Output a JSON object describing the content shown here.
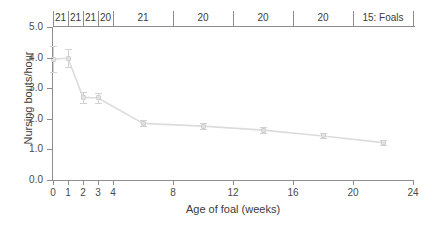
{
  "chart": {
    "ylabel": "Nursing bouts/hour",
    "xlabel": "Age of foal (weeks)",
    "y_ticks": [
      "0.0",
      "1.0",
      "2.0",
      "3.0",
      "4.0",
      "5.0"
    ],
    "x_ticks": [
      "0",
      "1",
      "2",
      "3",
      "4",
      "8",
      "12",
      "16",
      "20",
      "24"
    ],
    "sample_sizes": [
      {
        "label": "21",
        "x_start": 0,
        "x_end": 1
      },
      {
        "label": "21",
        "x_start": 1,
        "x_end": 2
      },
      {
        "label": "21",
        "x_start": 2,
        "x_end": 3
      },
      {
        "label": "20",
        "x_start": 3,
        "x_end": 4
      },
      {
        "label": "21",
        "x_start": 4,
        "x_end": 8
      },
      {
        "label": "20",
        "x_start": 8,
        "x_end": 12
      },
      {
        "label": "20",
        "x_start": 12,
        "x_end": 16
      },
      {
        "label": "20",
        "x_start": 16,
        "x_end": 20
      },
      {
        "label": "15: Foals",
        "x_start": 20,
        "x_end": 24
      }
    ]
  },
  "chart_data": {
    "type": "line",
    "title": "",
    "xlabel": "Age of foal (weeks)",
    "ylabel": "Nursing bouts/hour",
    "xlim": [
      0,
      24
    ],
    "ylim": [
      0.0,
      5.0
    ],
    "xticks": [
      0,
      1,
      2,
      3,
      4,
      8,
      12,
      16,
      20,
      24
    ],
    "yticks": [
      0.0,
      1.0,
      2.0,
      3.0,
      4.0,
      5.0
    ],
    "grid": false,
    "legend": "none",
    "error_bars": "standard error (vertical whiskers with caps)",
    "annotation_row": {
      "description": "Sample size (number of foals) per age interval, shown above the plot",
      "intervals": [
        "0-1",
        "1-2",
        "2-3",
        "3-4",
        "4-8",
        "8-12",
        "12-16",
        "16-20",
        "20-24"
      ],
      "values": [
        "21",
        "21",
        "21",
        "20",
        "21",
        "20",
        "20",
        "20",
        "15: Foals"
      ]
    },
    "series": [
      {
        "name": "Nursing bouts/hour",
        "x": [
          0,
          1,
          2,
          3,
          6,
          10,
          14,
          18,
          22
        ],
        "y": [
          3.95,
          3.98,
          2.7,
          2.68,
          1.85,
          1.76,
          1.63,
          1.44,
          1.22
        ],
        "yerr": [
          0.42,
          0.3,
          0.17,
          0.15,
          0.1,
          0.09,
          0.09,
          0.08,
          0.08
        ]
      }
    ]
  }
}
